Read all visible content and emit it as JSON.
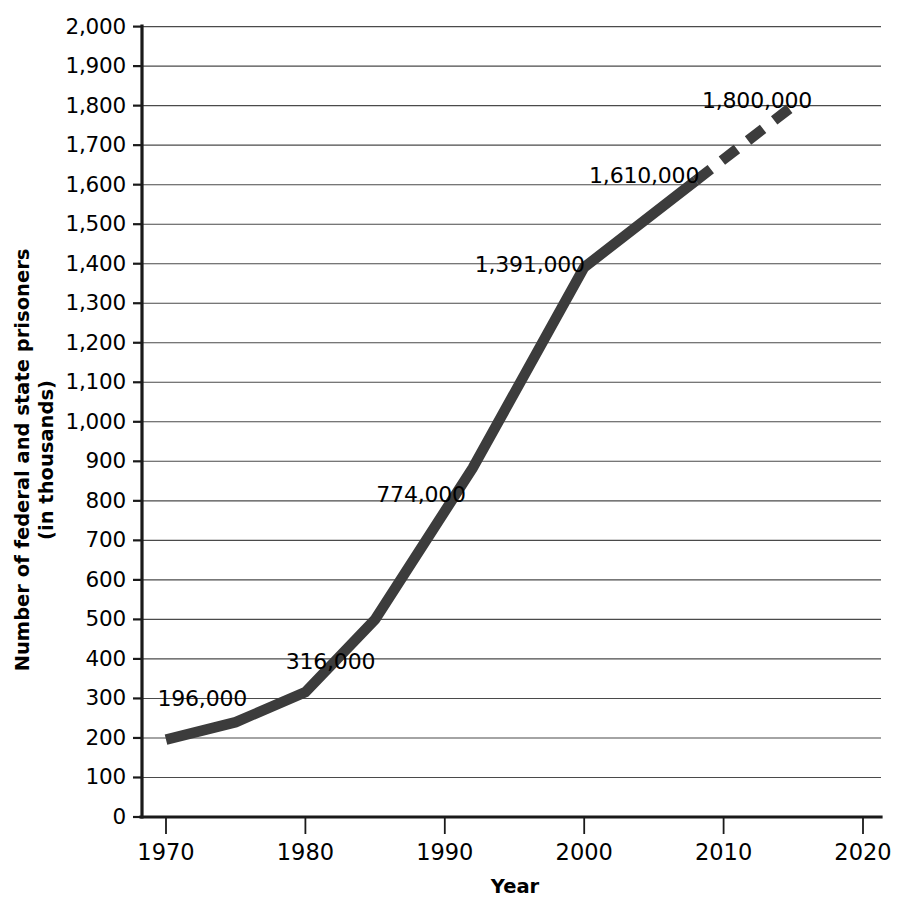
{
  "chart_data": {
    "type": "line",
    "title": "",
    "xlabel": "Year",
    "ylabel": "Number of federal and state prisoners\n(in thousands)",
    "ylabel_line1": "Number of federal and state prisoners",
    "ylabel_line2": "(in thousands)",
    "xlim": [
      1970,
      2020
    ],
    "ylim": [
      0,
      2000
    ],
    "grid": true,
    "legend": "none",
    "line_color": "#3c3c3c",
    "xticks": [
      1970,
      1980,
      1990,
      2000,
      2010,
      2020
    ],
    "xtick_labels": [
      "1970",
      "1980",
      "1990",
      "2000",
      "2010",
      "2020"
    ],
    "yticks": [
      0,
      100,
      200,
      300,
      400,
      500,
      600,
      700,
      800,
      900,
      1000,
      1100,
      1200,
      1300,
      1400,
      1500,
      1600,
      1700,
      1800,
      1900,
      2000
    ],
    "ytick_labels": [
      "0",
      "100",
      "200",
      "300",
      "400",
      "500",
      "600",
      "700",
      "800",
      "900",
      "1,000",
      "1,100",
      "1,200",
      "1,300",
      "1,400",
      "1,500",
      "1,600",
      "1,700",
      "1,800",
      "1,900",
      "2,000"
    ],
    "series": [
      {
        "name": "Actual (solid)",
        "style": "solid",
        "x": [
          1970,
          1975,
          1980,
          1985,
          1992,
          2000,
          2008
        ],
        "values": [
          196,
          240,
          316,
          500,
          883,
          1391,
          1610
        ]
      },
      {
        "name": "Projected (dashed)",
        "style": "dashed",
        "x": [
          2008,
          2015
        ],
        "values": [
          1610,
          1800
        ]
      }
    ],
    "annotations": [
      {
        "text": "196,000",
        "x": 1972.6,
        "y": 296,
        "anchor": "middle"
      },
      {
        "text": "316,000",
        "x": 1981.8,
        "y": 390,
        "anchor": "middle"
      },
      {
        "text": "774,000",
        "x": 1988.3,
        "y": 812,
        "anchor": "middle"
      },
      {
        "text": "1,391,000",
        "x": 1996.1,
        "y": 1395,
        "anchor": "middle"
      },
      {
        "text": "1,610,000",
        "x": 2004.3,
        "y": 1620,
        "anchor": "middle"
      },
      {
        "text": "1,800,000",
        "x": 2012.4,
        "y": 1808,
        "anchor": "middle"
      }
    ]
  }
}
